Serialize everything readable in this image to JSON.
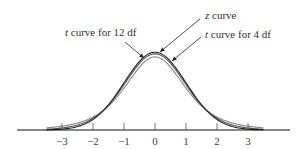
{
  "chart_data": {
    "type": "line",
    "title": "",
    "xlabel": "",
    "ylabel": "",
    "xlim": [
      -3.5,
      3.5
    ],
    "grid": false,
    "x_ticks": [
      -3,
      -2,
      -1,
      0,
      1,
      2,
      3
    ],
    "x_tick_labels": [
      "−3",
      "−2",
      "−1",
      "0",
      "1",
      "2",
      "3"
    ],
    "series": [
      {
        "name": "z curve",
        "df": null,
        "color": "#222222",
        "peak_density": 0.399
      },
      {
        "name": "t curve for 12 df",
        "df": 12,
        "color": "#555555",
        "peak_density": 0.391
      },
      {
        "name": "t curve for 4 df",
        "df": 4,
        "color": "#888888",
        "peak_density": 0.375
      }
    ],
    "annotations": [
      {
        "text": "z curve",
        "italic_prefix": "z",
        "rest": " curve",
        "points_to": "z curve peak"
      },
      {
        "text": "t curve for 12 df",
        "italic_prefix": "t",
        "rest": " curve for 12 df",
        "points_to": "t curve for 12 df"
      },
      {
        "text": "t curve for 4 df",
        "italic_prefix": "t",
        "rest": " curve for 4 df",
        "points_to": "t curve for 4 df"
      }
    ]
  }
}
